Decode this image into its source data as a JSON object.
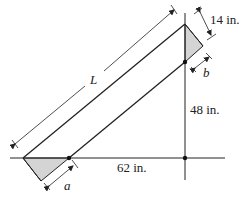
{
  "diagram": {
    "labels": {
      "length": "L",
      "width": "14 in.",
      "offset_a": "a",
      "offset_b": "b",
      "height": "48 in.",
      "horizontal": "62 in."
    },
    "colors": {
      "stroke": "#222222",
      "shaded": "#d4d4d4"
    }
  }
}
